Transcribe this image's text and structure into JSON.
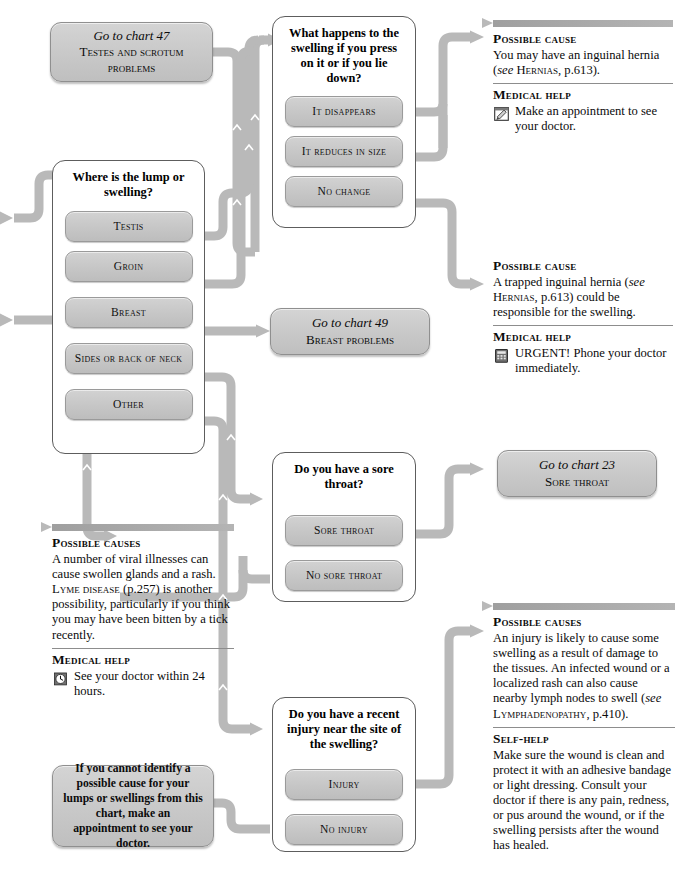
{
  "chart": {
    "accent_gray": "#b4b4b4",
    "box_fill": "#c8c8c8",
    "border_gray": "#5d5d5d"
  },
  "goto_47": {
    "line1": "Go to chart 47",
    "line2": "Testes and scrotum problems"
  },
  "goto_49": {
    "line1": "Go to chart 49",
    "line2": "Breast problems"
  },
  "goto_23": {
    "line1": "Go to chart 23",
    "line2": "Sore throat"
  },
  "q_swelling_press": {
    "question": "What happens to the swelling if you press on it or if you lie down?",
    "options": [
      {
        "label": "It disappears"
      },
      {
        "label": "It reduces in size"
      },
      {
        "label": "No change"
      }
    ]
  },
  "q_where_lump": {
    "question": "Where is the lump or swelling?",
    "options": [
      {
        "label": "Testis"
      },
      {
        "label": "Groin"
      },
      {
        "label": "Breast"
      },
      {
        "label": "Sides or back of neck"
      },
      {
        "label": "Other"
      }
    ]
  },
  "q_sore_throat": {
    "question": "Do you have a sore throat?",
    "options": [
      {
        "label": "Sore throat"
      },
      {
        "label": "No sore throat"
      }
    ]
  },
  "q_recent_injury": {
    "question": "Do you have a recent injury near the site of the swelling?",
    "options": [
      {
        "label": "Injury"
      },
      {
        "label": "No injury"
      }
    ]
  },
  "panel_hernia": {
    "cause_heading": "Possible cause",
    "cause_text_1": "You may have an inguinal hernia (",
    "cause_see": "see",
    "cause_ref": " Hernias",
    "cause_text_2": ", p.613).",
    "help_heading": "Medical help",
    "help_text": "Make an appointment to see your doctor.",
    "help_icon": "appointment-pad-icon"
  },
  "panel_trapped_hernia": {
    "cause_heading": "Possible cause",
    "cause_text_1": "A trapped inguinal hernia (",
    "cause_see": "see",
    "cause_ref": " Hernias",
    "cause_text_2": ", p.613) could be responsible for the swelling.",
    "help_heading": "Medical help",
    "help_text": "URGENT! Phone your doctor immediately.",
    "help_icon": "telephone-icon"
  },
  "panel_viral": {
    "cause_heading": "Possible causes",
    "cause_text_1": "A number of viral illnesses can cause swollen glands and a rash. ",
    "cause_ref": "Lyme disease",
    "cause_text_2": " (p.257) is another possibility, particularly if you think you may have been bitten by a tick recently.",
    "help_heading": "Medical help",
    "help_text": "See your doctor within 24 hours.",
    "help_icon": "clock-icon"
  },
  "panel_injury": {
    "cause_heading": "Possible causes",
    "cause_text_1": "An injury is likely to cause some swelling as a result of damage to the tissues. An infected wound or a localized rash can also cause nearby lymph nodes to swell (",
    "cause_see": "see",
    "cause_ref": " Lymphadenopathy",
    "cause_text_2": ", p.410).",
    "help_heading": "Self-help",
    "help_text": "Make sure the wound is clean and protect it with an adhesive bandage or light dressing. Consult your doctor if there is any pain, redness, or pus around the wound, or if the swelling persists after the wound has healed."
  },
  "advice_no_cause": {
    "text": "If you cannot identify a possible cause for your lumps or swellings from this chart, make an appointment to see your doctor."
  }
}
